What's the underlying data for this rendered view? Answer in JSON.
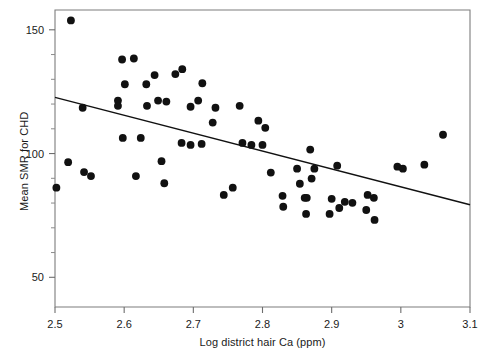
{
  "chart_data": {
    "type": "scatter",
    "title": "",
    "xlabel": "Log district hair Ca (ppm)",
    "ylabel": "Mean SMR for CHD",
    "xlim": [
      2.5,
      3.1
    ],
    "ylim": [
      38.0,
      158.0
    ],
    "xticks": [
      2.5,
      2.6,
      2.7,
      2.8,
      2.9,
      3,
      3.1
    ],
    "xticklabels": [
      "2.5",
      "2.6",
      "2.7",
      "2.8",
      "2.9",
      "3",
      "3.1"
    ],
    "yticks": [
      50,
      100,
      150
    ],
    "yticklabels": [
      "50",
      "100",
      "150"
    ],
    "yminorticks": [
      60,
      70,
      80,
      90,
      110,
      120,
      130,
      140
    ],
    "grid": false,
    "legend": null,
    "marker": {
      "shape": "circle",
      "color": "#111111",
      "size": 5
    },
    "points": [
      {
        "x": 2.523,
        "y": 153.8
      },
      {
        "x": 2.597,
        "y": 138.0
      },
      {
        "x": 2.614,
        "y": 138.4
      },
      {
        "x": 2.601,
        "y": 128.0
      },
      {
        "x": 2.632,
        "y": 128.0
      },
      {
        "x": 2.644,
        "y": 131.7
      },
      {
        "x": 2.591,
        "y": 121.4
      },
      {
        "x": 2.649,
        "y": 121.4
      },
      {
        "x": 2.54,
        "y": 118.5
      },
      {
        "x": 2.591,
        "y": 119.3
      },
      {
        "x": 2.633,
        "y": 119.3
      },
      {
        "x": 2.598,
        "y": 106.3
      },
      {
        "x": 2.624,
        "y": 106.3
      },
      {
        "x": 2.519,
        "y": 96.5
      },
      {
        "x": 2.654,
        "y": 96.9
      },
      {
        "x": 2.542,
        "y": 92.5
      },
      {
        "x": 2.658,
        "y": 88.0
      },
      {
        "x": 2.617,
        "y": 90.9
      },
      {
        "x": 2.552,
        "y": 90.9
      },
      {
        "x": 2.502,
        "y": 86.2
      },
      {
        "x": 2.684,
        "y": 134.1
      },
      {
        "x": 2.674,
        "y": 132.1
      },
      {
        "x": 2.713,
        "y": 128.4
      },
      {
        "x": 2.661,
        "y": 121.0
      },
      {
        "x": 2.696,
        "y": 118.9
      },
      {
        "x": 2.707,
        "y": 121.4
      },
      {
        "x": 2.732,
        "y": 118.5
      },
      {
        "x": 2.767,
        "y": 119.3
      },
      {
        "x": 2.728,
        "y": 112.5
      },
      {
        "x": 2.794,
        "y": 113.3
      },
      {
        "x": 2.804,
        "y": 110.4
      },
      {
        "x": 2.683,
        "y": 104.3
      },
      {
        "x": 2.696,
        "y": 103.5
      },
      {
        "x": 2.712,
        "y": 103.9
      },
      {
        "x": 2.771,
        "y": 104.3
      },
      {
        "x": 2.784,
        "y": 103.5
      },
      {
        "x": 2.8,
        "y": 103.5
      },
      {
        "x": 2.869,
        "y": 101.6
      },
      {
        "x": 2.85,
        "y": 93.9
      },
      {
        "x": 2.875,
        "y": 93.9
      },
      {
        "x": 2.908,
        "y": 95.1
      },
      {
        "x": 2.812,
        "y": 92.3
      },
      {
        "x": 2.871,
        "y": 89.9
      },
      {
        "x": 2.995,
        "y": 94.7
      },
      {
        "x": 3.003,
        "y": 93.9
      },
      {
        "x": 3.034,
        "y": 95.5
      },
      {
        "x": 2.854,
        "y": 87.8
      },
      {
        "x": 2.861,
        "y": 82.1
      },
      {
        "x": 2.864,
        "y": 82.1
      },
      {
        "x": 2.829,
        "y": 82.9
      },
      {
        "x": 2.9,
        "y": 81.7
      },
      {
        "x": 2.919,
        "y": 80.5
      },
      {
        "x": 2.952,
        "y": 83.3
      },
      {
        "x": 2.93,
        "y": 80.1
      },
      {
        "x": 2.961,
        "y": 82.1
      },
      {
        "x": 2.83,
        "y": 78.5
      },
      {
        "x": 2.863,
        "y": 75.6
      },
      {
        "x": 2.897,
        "y": 75.6
      },
      {
        "x": 2.911,
        "y": 78.0
      },
      {
        "x": 2.95,
        "y": 77.2
      },
      {
        "x": 2.962,
        "y": 73.2
      },
      {
        "x": 3.061,
        "y": 107.6
      },
      {
        "x": 2.757,
        "y": 86.2
      },
      {
        "x": 2.744,
        "y": 83.3
      }
    ],
    "fit_line": {
      "label": "regression line",
      "x_start": 2.5,
      "y_start": 122.7,
      "x_end": 3.1,
      "y_end": 79.3,
      "color": "#111111"
    }
  }
}
